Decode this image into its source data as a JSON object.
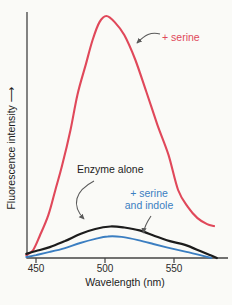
{
  "figure": {
    "background": "#fafaf7",
    "x_axis": {
      "label": "Wavelength (nm)",
      "ticks": [
        "450",
        "500",
        "550"
      ]
    },
    "y_axis": {
      "label": "Fluorescence intensity",
      "arrow": "⟶"
    },
    "annotations": {
      "serine": {
        "text": "+ serine",
        "color": "#e0485a"
      },
      "enzyme_alone": {
        "text": "Enzyme alone",
        "color": "#1c1c1c"
      },
      "serine_indole": {
        "line1": "+ serine",
        "line2": "and indole",
        "color": "#3b7ec1"
      }
    },
    "colors": {
      "axis": "#444444",
      "annotation_arrows": "#5a5a5a"
    }
  },
  "chart_data": {
    "type": "line",
    "title": "",
    "xlabel": "Wavelength (nm)",
    "ylabel": "Fluorescence intensity (relative, arbitrary units)",
    "xlim": [
      442,
      584
    ],
    "ylim": [
      0,
      102
    ],
    "x_ticks": [
      450,
      500,
      550
    ],
    "grid": false,
    "legend_position": "annotated-on-plot",
    "series": [
      {
        "id": "serine",
        "name": "+ serine",
        "color": "#e0485a",
        "stroke_width": 2.1,
        "points": [
          [
            443,
            1.2
          ],
          [
            448,
            3.3
          ],
          [
            453,
            9.5
          ],
          [
            459,
            17.8
          ],
          [
            464,
            28
          ],
          [
            469,
            38.4
          ],
          [
            475,
            52.9
          ],
          [
            480,
            67.4
          ],
          [
            486,
            79.8
          ],
          [
            491,
            90.1
          ],
          [
            496,
            97.5
          ],
          [
            501,
            100
          ],
          [
            507,
            97.5
          ],
          [
            514,
            92.1
          ],
          [
            522,
            81.8
          ],
          [
            530,
            68.6
          ],
          [
            538,
            55
          ],
          [
            546,
            42.6
          ],
          [
            553,
            28.1
          ],
          [
            560,
            21.1
          ],
          [
            567,
            16.5
          ],
          [
            574,
            14
          ],
          [
            579,
            13.2
          ]
        ]
      },
      {
        "id": "enzyme-alone",
        "name": "Enzyme alone",
        "color": "#1c1c1c",
        "stroke_width": 2.2,
        "points": [
          [
            443,
            1.7
          ],
          [
            450,
            2.9
          ],
          [
            460,
            4.5
          ],
          [
            471,
            7
          ],
          [
            482,
            9.9
          ],
          [
            493,
            12
          ],
          [
            504,
            13
          ],
          [
            514,
            12.6
          ],
          [
            525,
            11.4
          ],
          [
            536,
            9.1
          ],
          [
            547,
            7
          ],
          [
            558,
            5.4
          ],
          [
            569,
            2.9
          ],
          [
            576,
            1.2
          ],
          [
            581,
            0
          ]
        ]
      },
      {
        "id": "serine-indole",
        "name": "+ serine and indole",
        "color": "#3b7ec1",
        "stroke_width": 1.9,
        "points": [
          [
            443,
            0.4
          ],
          [
            450,
            1.2
          ],
          [
            460,
            2.5
          ],
          [
            471,
            4.1
          ],
          [
            482,
            6.2
          ],
          [
            493,
            7.9
          ],
          [
            502,
            8.9
          ],
          [
            512,
            8.7
          ],
          [
            524,
            7.4
          ],
          [
            535,
            5.8
          ],
          [
            547,
            4.1
          ],
          [
            559,
            2.5
          ],
          [
            569,
            1.2
          ],
          [
            577,
            0
          ]
        ]
      }
    ]
  }
}
